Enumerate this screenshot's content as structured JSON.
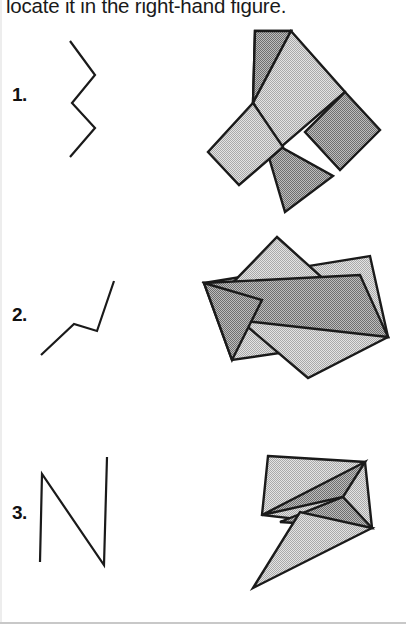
{
  "page": {
    "width": 406,
    "height": 624,
    "background": "#ffffff",
    "instruction": "locate it in the right-hand figure.",
    "bottom_rule_color": "#c8c8c8"
  },
  "style": {
    "stroke_color": "#1a1a1a",
    "fill_light": "#cfcfcf",
    "fill_dark": "#9d9d9d",
    "target_stroke_width": 2.2,
    "composite_stroke_width": 2.4
  },
  "rows": [
    {
      "number_label": "1.",
      "number_pos": {
        "x": 12,
        "y": 84
      },
      "target": {
        "name": "zigzag-polyline",
        "type": "polyline",
        "points": [
          [
            70,
            41
          ],
          [
            95,
            75
          ],
          [
            72,
            103
          ],
          [
            95,
            128
          ],
          [
            70,
            157
          ]
        ]
      },
      "composite": {
        "name": "squares-cluster",
        "type": "polygons",
        "shapes": [
          {
            "id": "square-top-dark",
            "shade": "dark",
            "points": [
              [
                255,
                31
              ],
              [
                291,
                31
              ],
              [
                253,
                103
              ],
              [
                253,
                103
              ]
            ]
          },
          {
            "id": "square-upper-left-dark",
            "points": [
              [
                255,
                31
              ],
              [
                291,
                31
              ],
              [
                253,
                103
              ],
              [
                253,
                103
              ]
            ],
            "shade": "dark"
          },
          {
            "id": "rect-diagonal-light",
            "shade": "light",
            "points": [
              [
                291,
                31
              ],
              [
                345,
                92
              ],
              [
                281,
                147
              ],
              [
                253,
                103
              ]
            ]
          },
          {
            "id": "square-right-dark",
            "shade": "dark",
            "points": [
              [
                345,
                92
              ],
              [
                380,
                130
              ],
              [
                340,
                170
              ],
              [
                305,
                132
              ]
            ]
          },
          {
            "id": "rect-lower-dark",
            "shade": "dark",
            "points": [
              [
                253,
                103
              ],
              [
                281,
                147
              ],
              [
                333,
                176
              ],
              [
                285,
                212
              ]
            ]
          },
          {
            "id": "square-lower-left-light",
            "shade": "light",
            "points": [
              [
                253,
                103
              ],
              [
                283,
                147
              ],
              [
                239,
                185
              ],
              [
                208,
                152
              ]
            ]
          }
        ]
      }
    },
    {
      "number_label": "2.",
      "number_pos": {
        "x": 12,
        "y": 304
      },
      "target": {
        "name": "rising-zigzag-polyline",
        "type": "polyline",
        "points": [
          [
            41,
            355
          ],
          [
            74,
            324
          ],
          [
            97,
            331
          ],
          [
            114,
            281
          ]
        ]
      },
      "composite": {
        "name": "overlapping-quadrilaterals",
        "type": "polygons",
        "shapes": [
          {
            "id": "quad-wide-light",
            "shade": "light",
            "points": [
              [
                204,
                283
              ],
              [
                370,
                256
              ],
              [
                388,
                337
              ],
              [
                232,
                360
              ]
            ]
          },
          {
            "id": "quad-tall-light",
            "shade": "light",
            "points": [
              [
                277,
                237
              ],
              [
                388,
                337
              ],
              [
                308,
                378
              ],
              [
                216,
                300
              ]
            ]
          },
          {
            "id": "quad-narrow-dark",
            "shade": "dark",
            "points": [
              [
                204,
                283
              ],
              [
                360,
                275
              ],
              [
                388,
                337
              ],
              [
                236,
                320
              ]
            ]
          },
          {
            "id": "triangle-left-dark",
            "shade": "dark",
            "points": [
              [
                204,
                283
              ],
              [
                262,
                300
              ],
              [
                232,
                360
              ]
            ]
          }
        ]
      }
    },
    {
      "number_label": "3.",
      "number_pos": {
        "x": 12,
        "y": 502
      },
      "target": {
        "name": "n-shape-polyline",
        "type": "polyline",
        "points": [
          [
            40,
            562
          ],
          [
            42,
            474
          ],
          [
            104,
            565
          ],
          [
            107,
            457
          ]
        ]
      },
      "composite": {
        "name": "kite-and-spike",
        "type": "polygons",
        "shapes": [
          {
            "id": "quad-main-light",
            "shade": "light",
            "points": [
              [
                268,
                456
              ],
              [
                365,
                462
              ],
              [
                372,
                528
              ],
              [
                262,
                515
              ]
            ]
          },
          {
            "id": "triangle-upper-dark",
            "shade": "dark",
            "points": [
              [
                262,
                515
              ],
              [
                365,
                462
              ],
              [
                343,
                497
              ]
            ]
          },
          {
            "id": "triangle-lower-dark",
            "shade": "dark",
            "points": [
              [
                343,
                497
              ],
              [
                372,
                528
              ],
              [
                280,
                522
              ]
            ]
          },
          {
            "id": "spike-triangle-light",
            "shade": "light",
            "points": [
              [
                253,
                588
              ],
              [
                372,
                528
              ],
              [
                300,
                512
              ]
            ]
          }
        ]
      }
    }
  ]
}
